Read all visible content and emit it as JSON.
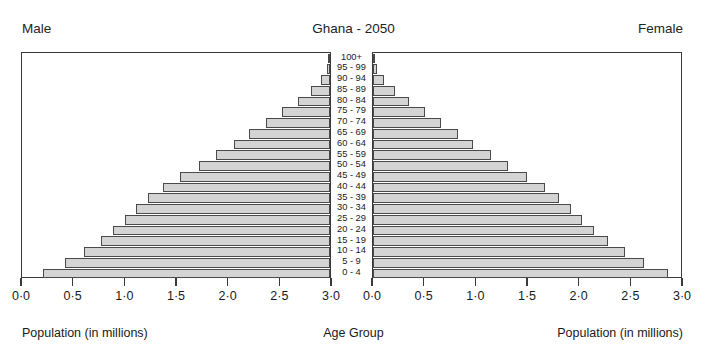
{
  "header": {
    "left_label": "Male",
    "title": "Ghana - 2050",
    "right_label": "Female"
  },
  "footer": {
    "left_label": "Population (in millions)",
    "center_label": "Age Group",
    "right_label": "Population (in millions)"
  },
  "axis": {
    "left_ticklabels": [
      "3·0",
      "2·5",
      "2·0",
      "1·5",
      "1·0",
      "0·5",
      "0·0"
    ],
    "right_ticklabels": [
      "0·0",
      "0·5",
      "1·0",
      "1·5",
      "2·0",
      "2·5",
      "3·0"
    ],
    "tick_values": [
      0.0,
      0.5,
      1.0,
      1.5,
      2.0,
      2.5,
      3.0
    ]
  },
  "style": {
    "bar_fill": "#d4d4d4",
    "bar_border": "#4a4a4a",
    "panel_border": "#3a3a3a",
    "text_color": "#1a1a1a"
  },
  "chart_data": {
    "type": "bar",
    "subtype": "population-pyramid",
    "title": "Ghana - 2050",
    "xlabel": "Population (in millions)",
    "ylabel": "Age Group",
    "xlim": [
      0,
      3.0
    ],
    "grid": false,
    "legend": [
      "Male",
      "Female"
    ],
    "categories": [
      "0 - 4",
      "5 - 9",
      "10 - 14",
      "15 - 19",
      "20 - 24",
      "25 - 29",
      "30 - 34",
      "35 - 39",
      "40 - 44",
      "45 - 49",
      "50 - 54",
      "55 - 59",
      "60 - 64",
      "65 - 69",
      "70 - 74",
      "75 - 79",
      "80 - 84",
      "85 - 89",
      "90 - 94",
      "95 - 99",
      "100+"
    ],
    "series": [
      {
        "name": "Male",
        "side": "left",
        "values": [
          2.78,
          2.56,
          2.38,
          2.22,
          2.1,
          1.98,
          1.88,
          1.76,
          1.62,
          1.45,
          1.27,
          1.1,
          0.93,
          0.78,
          0.62,
          0.46,
          0.31,
          0.18,
          0.09,
          0.03,
          0.01
        ]
      },
      {
        "name": "Female",
        "side": "right",
        "values": [
          2.85,
          2.62,
          2.44,
          2.27,
          2.14,
          2.02,
          1.92,
          1.8,
          1.66,
          1.49,
          1.31,
          1.14,
          0.97,
          0.82,
          0.66,
          0.5,
          0.35,
          0.21,
          0.11,
          0.04,
          0.01
        ]
      }
    ]
  }
}
